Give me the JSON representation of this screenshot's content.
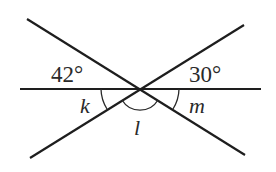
{
  "diagram": {
    "type": "intersecting-lines-angles",
    "intersection_point": {
      "x": 140,
      "y": 89
    },
    "lines": [
      {
        "id": "horizontal",
        "x1": 20,
        "y1": 89,
        "x2": 261,
        "y2": 89
      },
      {
        "id": "descending",
        "x1": 27,
        "y1": 19,
        "x2": 245,
        "y2": 155
      },
      {
        "id": "ascending",
        "x1": 244,
        "y1": 25,
        "x2": 30,
        "y2": 158
      }
    ],
    "labels": {
      "angle_top_left": "42°",
      "angle_top_right": "30°",
      "angle_k": "k",
      "angle_l": "l",
      "angle_m": "m"
    },
    "colors": {
      "stroke": "#1e1e1e",
      "text": "#2a2a2a",
      "background": "#ffffff"
    }
  }
}
